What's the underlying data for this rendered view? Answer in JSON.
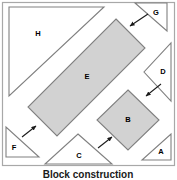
{
  "figure": {
    "caption": "Block construction",
    "frame_color": "#a8a8a8",
    "fill_gray": "#d2d2d2",
    "fill_white": "#ffffff",
    "stroke_color": "#808080",
    "label_color": "#000000"
  },
  "shapes": [
    {
      "id": "H",
      "label": "H",
      "kind": "triangle",
      "fill": "#ffffff",
      "points": "9,7 104,7 9,96",
      "label_x": 38,
      "label_y": 34
    },
    {
      "id": "G",
      "label": "G",
      "kind": "triangle",
      "fill": "#ffffff",
      "points": "135,3 167,3 167,31",
      "label_x": 156,
      "label_y": 12
    },
    {
      "id": "D",
      "label": "D",
      "kind": "triangle",
      "fill": "#ffffff",
      "points": "171,43 171,101 144,72",
      "label_x": 163,
      "label_y": 72
    },
    {
      "id": "E",
      "label": "E",
      "kind": "rectangle",
      "fill": "#d2d2d2",
      "points": "116,19 145,48 57,136 28,107",
      "label_x": 87,
      "label_y": 77
    },
    {
      "id": "B",
      "label": "B",
      "kind": "diamond",
      "fill": "#d2d2d2",
      "points": "128,90 159,120 128,150 97,120",
      "label_x": 128,
      "label_y": 120
    },
    {
      "id": "F",
      "label": "F",
      "kind": "triangle",
      "fill": "#ffffff",
      "points": "6,127 6,157 39,157",
      "label_x": 14,
      "label_y": 148
    },
    {
      "id": "C",
      "label": "C",
      "kind": "triangle",
      "fill": "#ffffff",
      "points": "78,134 112,164 45,164",
      "label_x": 79,
      "label_y": 156
    },
    {
      "id": "A",
      "label": "A",
      "kind": "triangle",
      "fill": "#ffffff",
      "points": "171,134 171,160 142,160",
      "label_x": 161,
      "label_y": 152
    }
  ],
  "arrows": [
    {
      "id": "arrow-to-e-top-right",
      "x1": 148,
      "y1": 14,
      "x2": 129,
      "y2": 26
    },
    {
      "id": "arrow-to-b-right",
      "x1": 161,
      "y1": 84,
      "x2": 145,
      "y2": 97
    },
    {
      "id": "arrow-to-e-lower-left",
      "x1": 22,
      "y1": 137,
      "x2": 36,
      "y2": 126
    },
    {
      "id": "arrow-to-b-lower-left",
      "x1": 98,
      "y1": 148,
      "x2": 112,
      "y2": 137
    }
  ]
}
